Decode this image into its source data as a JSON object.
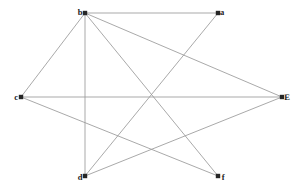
{
  "figure": {
    "width": 302,
    "height": 195,
    "background_color": "#ffffff",
    "edge_color": "#9a9a9a",
    "node_color": "#262626",
    "label_color": "#1a1a1a"
  },
  "graph_data": {
    "type": "node-link-diagram",
    "directed": false,
    "node_count": 6,
    "edge_count": 9,
    "nodes": [
      {
        "id": "b",
        "label": "b",
        "x": 85,
        "y": 13,
        "label_dx": -5,
        "label_dy": -1,
        "degree": 5
      },
      {
        "id": "a",
        "label": "a",
        "x": 218,
        "y": 13,
        "label_dx": 4,
        "label_dy": -1,
        "degree": 2
      },
      {
        "id": "c",
        "label": "c",
        "x": 21,
        "y": 97,
        "label_dx": -5,
        "label_dy": 0,
        "degree": 3
      },
      {
        "id": "E",
        "label": "E",
        "x": 282,
        "y": 97,
        "label_dx": 5,
        "label_dy": 0,
        "degree": 3
      },
      {
        "id": "d",
        "label": "d",
        "x": 85,
        "y": 176,
        "label_dx": -5,
        "label_dy": 1,
        "degree": 3
      },
      {
        "id": "f",
        "label": "f",
        "x": 218,
        "y": 176,
        "label_dx": 5,
        "label_dy": 1,
        "degree": 2
      }
    ],
    "edges": [
      {
        "id": "edge-b-a",
        "source": "b",
        "target": "a"
      },
      {
        "id": "edge-b-c",
        "source": "b",
        "target": "c"
      },
      {
        "id": "edge-b-d",
        "source": "b",
        "target": "d"
      },
      {
        "id": "edge-b-E",
        "source": "b",
        "target": "E"
      },
      {
        "id": "edge-b-f",
        "source": "b",
        "target": "f"
      },
      {
        "id": "edge-c-E",
        "source": "c",
        "target": "E"
      },
      {
        "id": "edge-c-f",
        "source": "c",
        "target": "f"
      },
      {
        "id": "edge-d-a",
        "source": "d",
        "target": "a"
      },
      {
        "id": "edge-d-E",
        "source": "d",
        "target": "E"
      }
    ]
  }
}
